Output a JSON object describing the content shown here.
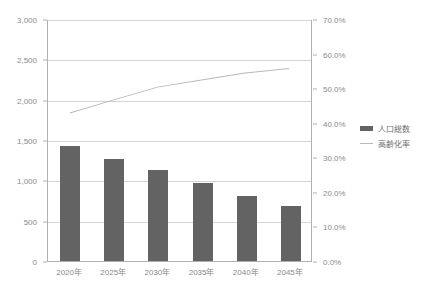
{
  "chart_data": {
    "type": "bar",
    "title": "",
    "xlabel": "",
    "ylabel": "",
    "grid": true,
    "legend_position": "right",
    "categories": [
      "2020年",
      "2025年",
      "2030年",
      "2035年",
      "2040年",
      "2045年"
    ],
    "series": [
      {
        "name": "人口総数",
        "type": "bar",
        "axis": "left",
        "color": "#636363",
        "values": [
          1420,
          1270,
          1125,
          970,
          810,
          680
        ]
      },
      {
        "name": "高齢化率",
        "type": "line",
        "axis": "right",
        "color": "#b9b9b9",
        "values": [
          43.0,
          46.8,
          50.5,
          52.6,
          54.6,
          55.9
        ]
      }
    ],
    "y_left": {
      "min": 0,
      "max": 3000,
      "step": 500,
      "ticks": [
        "0",
        "500",
        "1,000",
        "1,500",
        "2,000",
        "2,500",
        "3,000"
      ],
      "tick_values": [
        0,
        500,
        1000,
        1500,
        2000,
        2500,
        3000
      ]
    },
    "y_right": {
      "min": 0,
      "max": 70,
      "step": 10,
      "ticks": [
        "0.0%",
        "10.0%",
        "20.0%",
        "30.0%",
        "40.0%",
        "50.0%",
        "60.0%",
        "70.0%"
      ],
      "tick_values": [
        0,
        10,
        20,
        30,
        40,
        50,
        60,
        70
      ]
    }
  },
  "legend": {
    "items": [
      {
        "label": "人口総数"
      },
      {
        "label": "高齢化率"
      }
    ]
  }
}
